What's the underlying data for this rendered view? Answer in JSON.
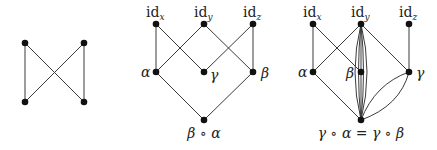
{
  "diagrams": [
    {
      "name": "crossed-graph",
      "nodes": [
        {
          "id": "a",
          "x": 25,
          "y": 43,
          "label": ""
        },
        {
          "id": "b",
          "x": 84,
          "y": 43,
          "label": ""
        },
        {
          "id": "c",
          "x": 25,
          "y": 102,
          "label": ""
        },
        {
          "id": "d",
          "x": 84,
          "y": 102,
          "label": ""
        }
      ],
      "edges": [
        [
          "a",
          "c"
        ],
        [
          "b",
          "d"
        ],
        [
          "a",
          "d"
        ],
        [
          "b",
          "c"
        ]
      ]
    },
    {
      "name": "lattice-beta-alpha",
      "labels": {
        "idx_base": "id",
        "idx_sub": "x",
        "idy_base": "id",
        "idy_sub": "y",
        "idz_base": "id",
        "idz_sub": "z",
        "alpha": "α",
        "gamma": "γ",
        "beta": "β",
        "bottom": "β ∘ α"
      },
      "nodes": [
        {
          "id": "idx",
          "x": 156,
          "y": 24
        },
        {
          "id": "idy",
          "x": 204,
          "y": 24
        },
        {
          "id": "idz",
          "x": 253,
          "y": 24
        },
        {
          "id": "alpha",
          "x": 156,
          "y": 72
        },
        {
          "id": "gamma",
          "x": 204,
          "y": 72
        },
        {
          "id": "beta",
          "x": 253,
          "y": 72
        },
        {
          "id": "comp",
          "x": 204,
          "y": 120
        }
      ],
      "edges": [
        [
          "idx",
          "alpha"
        ],
        [
          "idx",
          "gamma"
        ],
        [
          "idy",
          "alpha"
        ],
        [
          "idy",
          "beta"
        ],
        [
          "idz",
          "gamma"
        ],
        [
          "idz",
          "beta"
        ],
        [
          "alpha",
          "comp"
        ],
        [
          "beta",
          "comp"
        ]
      ]
    },
    {
      "name": "lattice-gamma-compositions",
      "labels": {
        "idx_base": "id",
        "idx_sub": "x",
        "idy_base": "id",
        "idy_sub": "y",
        "idz_base": "id",
        "idz_sub": "z",
        "alpha": "α",
        "beta": "β",
        "gamma": "γ",
        "bottom": "γ ∘ α = γ ∘ β"
      },
      "nodes": [
        {
          "id": "idx",
          "x": 313,
          "y": 24
        },
        {
          "id": "idy",
          "x": 361,
          "y": 24
        },
        {
          "id": "idz",
          "x": 409,
          "y": 24
        },
        {
          "id": "alpha",
          "x": 313,
          "y": 72
        },
        {
          "id": "beta",
          "x": 361,
          "y": 72
        },
        {
          "id": "gamma",
          "x": 409,
          "y": 72
        },
        {
          "id": "comp",
          "x": 361,
          "y": 120
        }
      ],
      "edges": [
        [
          "idx",
          "alpha"
        ],
        [
          "idx",
          "beta"
        ],
        [
          "idy",
          "alpha"
        ],
        [
          "idy",
          "gamma"
        ],
        [
          "idy",
          "beta"
        ],
        [
          "idz",
          "gamma"
        ],
        [
          "alpha",
          "comp"
        ],
        [
          "idy",
          "comp",
          "curved-multi"
        ],
        [
          "gamma",
          "comp",
          "curved-double"
        ]
      ]
    }
  ]
}
